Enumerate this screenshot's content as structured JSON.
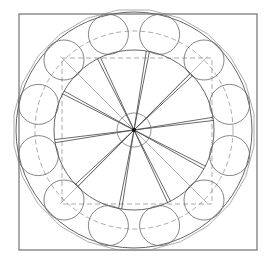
{
  "diagram": {
    "title": "",
    "center": [
      134,
      130
    ],
    "frame": {
      "x": 19,
      "y": 14,
      "w": 238,
      "h": 236
    },
    "outer_circle_r": 118,
    "inner_circle_r": 80,
    "hub_circle_r": 17,
    "dashed_circle_r": 99,
    "dashed_square": {
      "x": 62,
      "y": 58,
      "w": 150,
      "h": 146
    },
    "ring_circles": {
      "count": 12,
      "orbit_r": 99,
      "r": 20,
      "start_deg": -75
    },
    "polygon": {
      "sides": 24,
      "r": 121
    },
    "spokes": {
      "count": 10,
      "start_deg": -80,
      "r_end": 80
    },
    "diagonals_r": 99,
    "colors": {
      "stroke": "#555555",
      "light": "#8a8a8a",
      "dash": "#777777",
      "background": "#ffffff"
    }
  }
}
